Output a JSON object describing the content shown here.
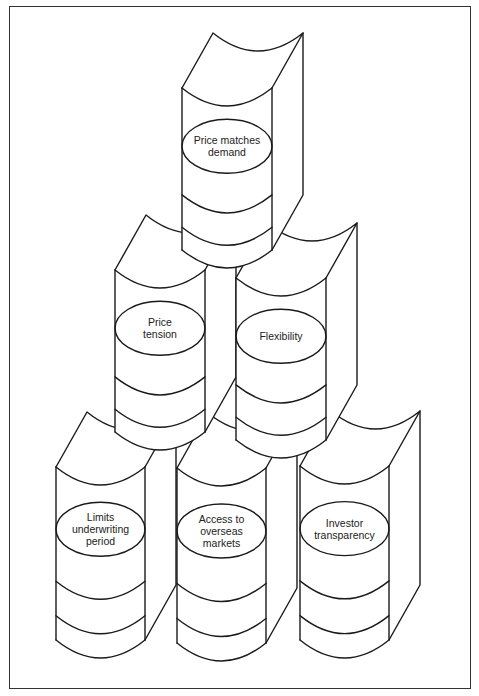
{
  "figure": {
    "type": "stacked-books-pyramid",
    "stroke_color": "#1a1a1a",
    "background": "#ffffff"
  },
  "books": [
    {
      "id": "price-matches-demand",
      "label": "Price matches\ndemand",
      "row": "top",
      "order": 0,
      "spine_left": 182,
      "spine_width": 90,
      "spine_top": 88,
      "spine_bottom": 250
    },
    {
      "id": "price-tension",
      "label": "Price\ntension",
      "row": "middle",
      "order": 1,
      "spine_left": 115,
      "spine_width": 90,
      "spine_top": 270,
      "spine_bottom": 432
    },
    {
      "id": "flexibility",
      "label": "Flexibility",
      "row": "middle",
      "order": 2,
      "spine_left": 236,
      "spine_width": 90,
      "spine_top": 278,
      "spine_bottom": 440
    },
    {
      "id": "limits-underwriting-period",
      "label": "Limits\nunderwriting\nperiod",
      "row": "bottom",
      "order": 3,
      "spine_left": 56,
      "spine_width": 89,
      "spine_top": 467,
      "spine_bottom": 640
    },
    {
      "id": "access-to-overseas-markets",
      "label": "Access to\noverseas\nmarkets",
      "row": "bottom",
      "order": 4,
      "spine_left": 177,
      "spine_width": 89,
      "spine_top": 468,
      "spine_bottom": 643
    },
    {
      "id": "investor-transparency",
      "label": "Investor\ntransparency",
      "row": "bottom",
      "order": 5,
      "spine_left": 300,
      "spine_width": 89,
      "spine_top": 466,
      "spine_bottom": 640
    }
  ]
}
